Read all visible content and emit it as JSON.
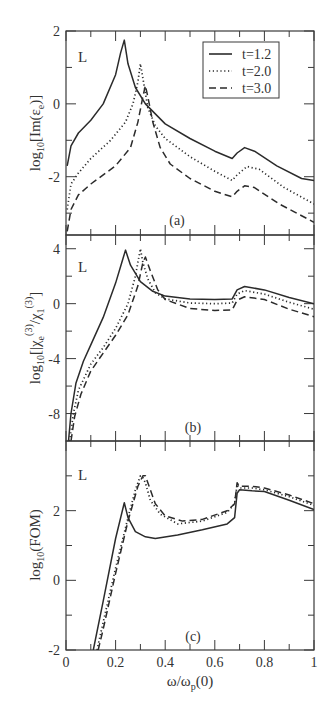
{
  "figure": {
    "xlabel_main": "ω/ω",
    "xlabel_sub": "p",
    "xlabel_tail": "(0)"
  },
  "legend": {
    "entries": [
      {
        "label": "t=1.2",
        "style": "solid"
      },
      {
        "label": "t=2.0",
        "style": "dotted"
      },
      {
        "label": "t=3.0",
        "style": "dashed"
      }
    ]
  },
  "colors": {
    "line": "#2b2b2b",
    "axis": "#3a3a3a",
    "background": "#ffffff"
  },
  "chart_data": [
    {
      "type": "line",
      "panel": "(a)",
      "title": "",
      "corner_label": "L",
      "xlabel": "ω/ωp(0)",
      "ylabel": "log10[Im(εe)]",
      "ylabel_parts": {
        "pre": "log",
        "sub1": "10",
        "mid": "[Im(ε",
        "sub2": "e",
        "post": ")]"
      },
      "xlim": [
        0,
        1
      ],
      "ylim": [
        -3.6,
        2
      ],
      "yticks": [
        2,
        0,
        -2
      ],
      "yticks_minor": [
        1,
        -1,
        -3
      ],
      "xticks": [
        0,
        0.2,
        0.4,
        0.6,
        0.8,
        1
      ],
      "xticks_minor": [
        0.1,
        0.3,
        0.5,
        0.7,
        0.9
      ],
      "grid": false,
      "legend_position": "upper right",
      "series": [
        {
          "name": "t=1.2",
          "style": "solid",
          "x": [
            0.005,
            0.02,
            0.05,
            0.1,
            0.15,
            0.2,
            0.22,
            0.235,
            0.25,
            0.28,
            0.32,
            0.4,
            0.5,
            0.6,
            0.67,
            0.69,
            0.72,
            0.76,
            0.85,
            0.95,
            1.0
          ],
          "y": [
            -1.7,
            -1.15,
            -0.8,
            -0.45,
            0.0,
            0.8,
            1.4,
            1.75,
            1.1,
            0.45,
            0.0,
            -0.55,
            -0.95,
            -1.3,
            -1.5,
            -1.35,
            -1.2,
            -1.3,
            -1.7,
            -2.05,
            -2.1
          ]
        },
        {
          "name": "t=2.0",
          "style": "dotted",
          "x": [
            0.005,
            0.02,
            0.05,
            0.1,
            0.18,
            0.24,
            0.27,
            0.29,
            0.3,
            0.31,
            0.33,
            0.36,
            0.4,
            0.5,
            0.6,
            0.67,
            0.69,
            0.73,
            0.78,
            0.88,
            1.0
          ],
          "y": [
            -2.9,
            -2.2,
            -1.9,
            -1.5,
            -1.0,
            -0.5,
            0.0,
            0.6,
            1.1,
            0.7,
            -0.1,
            -0.6,
            -0.95,
            -1.45,
            -1.85,
            -2.1,
            -1.95,
            -1.72,
            -1.8,
            -2.3,
            -2.75
          ]
        },
        {
          "name": "t=3.0",
          "style": "dashed",
          "x": [
            0.005,
            0.02,
            0.05,
            0.1,
            0.2,
            0.26,
            0.29,
            0.31,
            0.32,
            0.33,
            0.35,
            0.38,
            0.42,
            0.5,
            0.6,
            0.67,
            0.69,
            0.72,
            0.76,
            0.86,
            1.0
          ],
          "y": [
            -3.5,
            -2.9,
            -2.5,
            -2.2,
            -1.7,
            -1.2,
            -0.5,
            0.2,
            0.5,
            0.2,
            -0.5,
            -1.2,
            -1.65,
            -2.05,
            -2.4,
            -2.55,
            -2.4,
            -2.25,
            -2.3,
            -2.75,
            -3.25
          ]
        }
      ]
    },
    {
      "type": "line",
      "panel": "(b)",
      "title": "",
      "corner_label": "L",
      "xlabel": "ω/ωp(0)",
      "ylabel": "log10[|χe(3)/χ1(3)]",
      "ylabel_parts": {
        "pre": "log",
        "sub1": "10",
        "mid": "[|χ",
        "sub2": "e",
        "sup2": "(3)",
        "mid2": "/χ",
        "sub3": "1",
        "sup3": "(3)",
        "post": "]"
      },
      "xlim": [
        0,
        1
      ],
      "ylim": [
        -10,
        5
      ],
      "yticks": [
        4,
        0,
        -4,
        -8
      ],
      "yticks_minor": [
        2,
        -2,
        -6
      ],
      "xticks": [
        0,
        0.2,
        0.4,
        0.6,
        0.8,
        1
      ],
      "xticks_minor": [
        0.1,
        0.3,
        0.5,
        0.7,
        0.9
      ],
      "grid": false,
      "series": [
        {
          "name": "t=1.2",
          "style": "solid",
          "x": [
            0.01,
            0.02,
            0.04,
            0.07,
            0.1,
            0.15,
            0.2,
            0.225,
            0.24,
            0.26,
            0.3,
            0.35,
            0.4,
            0.5,
            0.6,
            0.67,
            0.69,
            0.72,
            0.8,
            0.9,
            1.0
          ],
          "y": [
            -10,
            -8.0,
            -5.8,
            -4.2,
            -3.0,
            -1.0,
            1.5,
            3.0,
            3.9,
            2.8,
            1.6,
            0.9,
            0.55,
            0.35,
            0.3,
            0.35,
            1.0,
            1.25,
            1.0,
            0.45,
            0.0
          ]
        },
        {
          "name": "t=2.0",
          "style": "dotted",
          "x": [
            0.015,
            0.03,
            0.05,
            0.1,
            0.15,
            0.2,
            0.25,
            0.28,
            0.3,
            0.31,
            0.33,
            0.36,
            0.4,
            0.5,
            0.6,
            0.67,
            0.69,
            0.72,
            0.8,
            0.9,
            1.0
          ],
          "y": [
            -10,
            -8.0,
            -6.3,
            -4.4,
            -3.2,
            -1.8,
            0.0,
            2.0,
            4.0,
            3.0,
            1.8,
            0.8,
            0.35,
            0.05,
            0.0,
            0.05,
            0.7,
            0.95,
            0.7,
            0.1,
            -0.4
          ]
        },
        {
          "name": "t=3.0",
          "style": "dashed",
          "x": [
            0.02,
            0.035,
            0.06,
            0.1,
            0.15,
            0.2,
            0.25,
            0.29,
            0.31,
            0.32,
            0.34,
            0.37,
            0.4,
            0.5,
            0.6,
            0.67,
            0.69,
            0.72,
            0.8,
            0.9,
            1.0
          ],
          "y": [
            -10,
            -8.2,
            -6.6,
            -4.9,
            -3.6,
            -2.3,
            -0.8,
            1.3,
            3.0,
            3.4,
            2.4,
            1.0,
            0.3,
            -0.35,
            -0.5,
            -0.45,
            0.25,
            0.5,
            0.3,
            -0.4,
            -0.95
          ]
        }
      ]
    },
    {
      "type": "line",
      "panel": "(c)",
      "title": "",
      "corner_label": "L",
      "xlabel": "ω/ωp(0)",
      "ylabel": "log10(FOM)",
      "ylabel_parts": {
        "pre": "log",
        "sub1": "10",
        "post": "(FOM)"
      },
      "xlim": [
        0,
        1
      ],
      "ylim": [
        -2,
        4
      ],
      "yticks": [
        2,
        0,
        -2
      ],
      "yticks_minor": [
        3,
        1,
        -1
      ],
      "xticks": [
        0,
        0.2,
        0.4,
        0.6,
        0.8,
        1
      ],
      "xticks_minor": [
        0.1,
        0.3,
        0.5,
        0.7,
        0.9
      ],
      "xticklabels": [
        "0",
        "0.2",
        "0.4",
        "0.6",
        "0.8",
        "1"
      ],
      "grid": false,
      "series": [
        {
          "name": "t=1.2",
          "style": "solid",
          "x": [
            0.11,
            0.15,
            0.2,
            0.235,
            0.25,
            0.28,
            0.32,
            0.36,
            0.45,
            0.55,
            0.65,
            0.68,
            0.69,
            0.7,
            0.75,
            0.8,
            0.9,
            1.0
          ],
          "y": [
            -2.0,
            -0.6,
            1.2,
            2.23,
            1.8,
            1.4,
            1.25,
            1.2,
            1.3,
            1.45,
            1.62,
            1.8,
            2.5,
            2.6,
            2.57,
            2.55,
            2.3,
            2.03
          ]
        },
        {
          "name": "t=2.0",
          "style": "dotted",
          "x": [
            0.125,
            0.15,
            0.2,
            0.25,
            0.28,
            0.3,
            0.31,
            0.32,
            0.34,
            0.38,
            0.45,
            0.55,
            0.65,
            0.68,
            0.69,
            0.7,
            0.75,
            0.8,
            0.9,
            1.0
          ],
          "y": [
            -2.0,
            -1.2,
            0.35,
            1.8,
            2.6,
            3.0,
            2.95,
            2.8,
            2.3,
            1.9,
            1.62,
            1.7,
            1.95,
            2.2,
            2.75,
            2.65,
            2.65,
            2.6,
            2.4,
            2.15
          ]
        },
        {
          "name": "t=3.0",
          "style": "dashed",
          "x": [
            0.13,
            0.15,
            0.2,
            0.25,
            0.29,
            0.31,
            0.32,
            0.335,
            0.36,
            0.4,
            0.47,
            0.55,
            0.65,
            0.68,
            0.69,
            0.7,
            0.75,
            0.8,
            0.9,
            1.0
          ],
          "y": [
            -2.0,
            -1.4,
            0.2,
            1.7,
            2.7,
            3.0,
            3.0,
            2.7,
            2.2,
            1.85,
            1.7,
            1.75,
            2.0,
            2.2,
            2.8,
            2.7,
            2.7,
            2.65,
            2.45,
            2.2
          ]
        }
      ]
    }
  ]
}
